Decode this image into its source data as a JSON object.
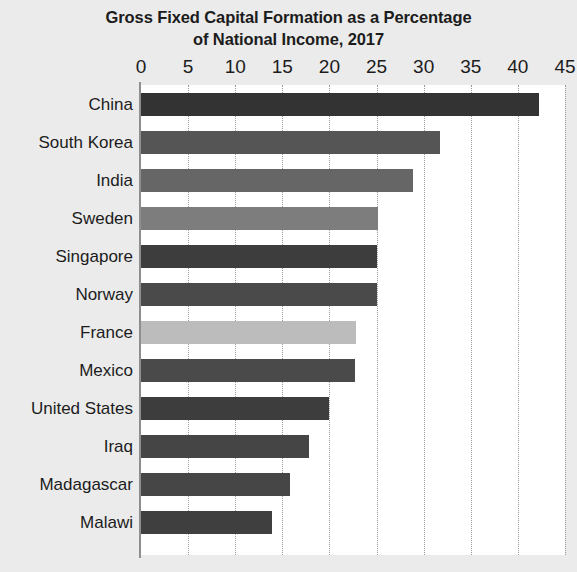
{
  "chart_data": {
    "type": "bar",
    "orientation": "horizontal",
    "title": "Gross Fixed Capital Formation as a Percentage of National Income, 2017",
    "title_lines": [
      "Gross Fixed Capital Formation as a Percentage",
      "of National Income, 2017"
    ],
    "xlabel": "",
    "ylabel": "",
    "xlim": [
      0,
      45
    ],
    "ylim": null,
    "grid": true,
    "grid_axis": "x",
    "legend": false,
    "xticks": [
      0,
      5,
      10,
      15,
      20,
      25,
      30,
      35,
      40,
      45
    ],
    "xtick_labels": [
      "0",
      "5",
      "10",
      "15",
      "20",
      "25",
      "30",
      "35",
      "40",
      "45"
    ],
    "categories": [
      "China",
      "South Korea",
      "India",
      "Sweden",
      "Singapore",
      "Norway",
      "France",
      "Mexico",
      "United States",
      "Iraq",
      "Madagascar",
      "Malawi"
    ],
    "values": [
      42.2,
      31.7,
      28.9,
      25.2,
      25.1,
      25.0,
      22.8,
      22.7,
      20.0,
      17.8,
      15.8,
      13.9
    ],
    "bar_colors": [
      "#333333",
      "#555555",
      "#666666",
      "#7d7d7d",
      "#3d3d3d",
      "#4a4a4a",
      "#bcbcbc",
      "#4a4a4a",
      "#3d3d3d",
      "#454545",
      "#464646",
      "#3f3f3f"
    ]
  },
  "colors": {
    "page_background": "#ebebeb",
    "plot_background": "#ffffff",
    "text": "#1c1c1c",
    "axis": "#8e8e8e",
    "gridline": "#9a9a9a"
  }
}
